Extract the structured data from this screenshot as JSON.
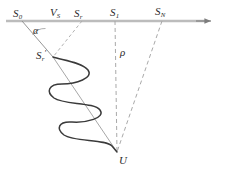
{
  "figure": {
    "name": "wave-propagation-geometry-diagram",
    "background_color": "#ffffff",
    "width": 226,
    "height": 180,
    "axis": {
      "name": "horizontal-axis",
      "color": "#b9b9b9",
      "y": 21,
      "x_start": 6,
      "x_end": 214,
      "arrowhead": "right"
    },
    "colors": {
      "axis_line": "#b9b9b9",
      "dashed_line": "#a9a9a9",
      "solid_thin_line": "#8a8a8a",
      "wave_curve": "#3a3a3a",
      "text": "#2b2b2b"
    },
    "labels": {
      "s0": {
        "base": "S",
        "sub": "0",
        "prime": ""
      },
      "vs": {
        "base": "V",
        "sub": "S",
        "prime": ""
      },
      "sr": {
        "base": "S",
        "sub": "r",
        "prime": ""
      },
      "s1": {
        "base": "S",
        "sub": "1",
        "prime": ""
      },
      "sn": {
        "base": "S",
        "sub": "N",
        "prime": ""
      },
      "alpha": {
        "base": "α",
        "sub": "",
        "prime": ""
      },
      "sr_prime": {
        "base": "S",
        "sub": "r",
        "prime": "′"
      },
      "rho": {
        "base": "ρ",
        "sub": "",
        "prime": ""
      },
      "u": {
        "base": "U",
        "sub": "",
        "prime": ""
      }
    },
    "points": {
      "S0": {
        "x": 22,
        "y": 21
      },
      "VS": {
        "x": 56,
        "y": 21
      },
      "Sr": {
        "x": 82,
        "y": 21
      },
      "S1": {
        "x": 115,
        "y": 21
      },
      "SN": {
        "x": 162,
        "y": 21
      },
      "Sr_prime": {
        "x": 53,
        "y": 57
      },
      "U": {
        "x": 117,
        "y": 152
      }
    },
    "segments": [
      {
        "name": "s0-to-srprime",
        "from": "S0",
        "to": "Sr_prime",
        "style": "solid-thin"
      },
      {
        "name": "sr-to-srprime",
        "from": "Sr",
        "to": "Sr_prime",
        "style": "dashed"
      },
      {
        "name": "srprime-to-u-axis",
        "from": "Sr_prime",
        "to": "U",
        "style": "solid-thin"
      },
      {
        "name": "s1-to-u-rho",
        "from": "S1",
        "to": "U",
        "style": "dashed"
      },
      {
        "name": "sn-to-u",
        "from": "SN",
        "to": "U",
        "style": "dashed"
      }
    ],
    "wave": {
      "name": "sinusoidal-wave-along-ray",
      "from": "Sr_prime",
      "to": "U",
      "cycles": 4,
      "amplitude_px": 30,
      "stroke_color": "#3a3a3a",
      "stroke_width": 1.5
    }
  }
}
